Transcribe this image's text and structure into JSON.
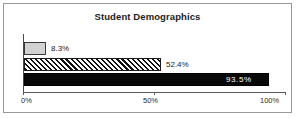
{
  "chart_data": {
    "type": "bar",
    "orientation": "horizontal",
    "title": "Student Demographics",
    "xlabel": "",
    "ylabel": "",
    "categories": [
      "series-1",
      "series-2",
      "series-3"
    ],
    "values": [
      8.3,
      52.4,
      93.5
    ],
    "data_labels": [
      "8.3%",
      "52.4%",
      "93.5%"
    ],
    "xlim": [
      0,
      100
    ],
    "xticks": [
      0,
      50,
      100
    ],
    "xtick_labels": [
      "0%",
      "50%",
      "100%"
    ],
    "grid": false,
    "legend": false,
    "bar_styles": [
      "solid-light-gray",
      "diagonal-hatch",
      "solid-black"
    ],
    "colors": {
      "bar_1_fill": "#d2d2d2",
      "bar_2_fill": "#ffffff",
      "bar_2_hatch": "#111111",
      "bar_3_fill": "#080808",
      "bar_outline": "#1a1a1a",
      "axis": "#5a5a5a",
      "text": "#1b1b1b",
      "inner_label_text": "#ffffff",
      "frame_border": "#9a9a9a",
      "background": "#ffffff"
    }
  }
}
